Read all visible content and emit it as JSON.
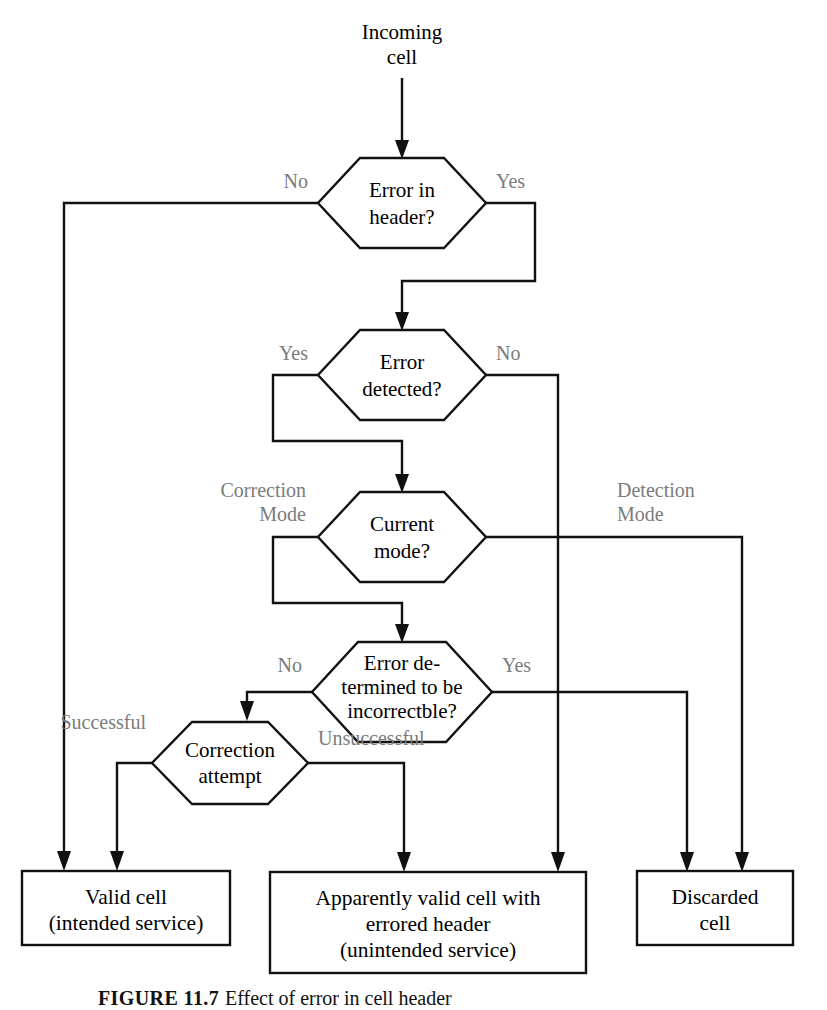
{
  "figure": {
    "caption_label": "FIGURE 11.7",
    "caption_text": "Effect of error in cell header",
    "colors": {
      "line": "#111111",
      "shape_text": "#000000",
      "edge_label": "#7b7b7b",
      "background": "#ffffff"
    }
  },
  "start": {
    "label_line1": "Incoming",
    "label_line2": "cell"
  },
  "decisions": [
    {
      "id": "error-in-header",
      "line1": "Error in",
      "line2": "header?",
      "left_label": "No",
      "right_label": "Yes"
    },
    {
      "id": "error-detected",
      "line1": "Error",
      "line2": "detected?",
      "left_label": "Yes",
      "right_label": "No"
    },
    {
      "id": "current-mode",
      "line1": "Current",
      "line2": "mode?",
      "left_label_line1": "Correction",
      "left_label_line2": "Mode",
      "right_label_line1": "Detection",
      "right_label_line2": "Mode"
    },
    {
      "id": "error-incorrectble",
      "line1": "Error de-",
      "line2": "termined to be",
      "line3": "incorrectble?",
      "left_label": "No",
      "right_label": "Yes"
    },
    {
      "id": "correction-attempt",
      "line1": "Correction",
      "line2": "attempt",
      "left_label": "Successful",
      "right_label": "Unsuccessful"
    }
  ],
  "terminals": [
    {
      "id": "valid-cell",
      "line1": "Valid cell",
      "line2": "(intended service)"
    },
    {
      "id": "apparently-valid-cell",
      "line1": "Apparently valid cell with",
      "line2": "errored header",
      "line3": "(unintended service)"
    },
    {
      "id": "discarded-cell",
      "line1": "Discarded",
      "line2": "cell"
    }
  ]
}
